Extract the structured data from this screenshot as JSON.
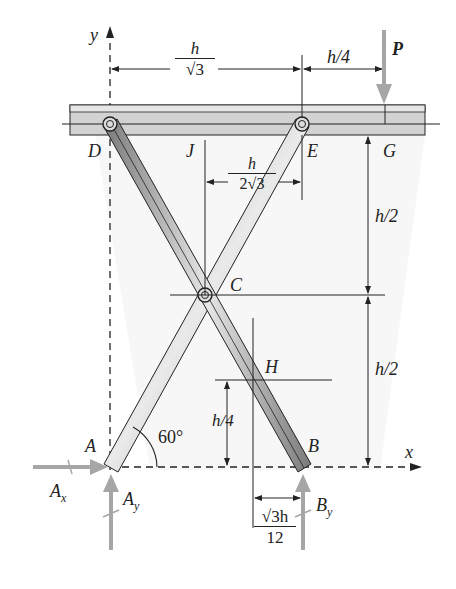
{
  "diagram": {
    "type": "scissor-lift free body diagram",
    "axes": {
      "x_label": "x",
      "y_label": "y"
    },
    "points": {
      "A": "A",
      "B": "B",
      "C": "C",
      "D": "D",
      "E": "E",
      "G": "G",
      "H": "H",
      "J": "J"
    },
    "load": {
      "label": "P"
    },
    "reactions": {
      "Ax": {
        "main": "A",
        "sub": "x"
      },
      "Ay": {
        "main": "A",
        "sub": "y"
      },
      "By": {
        "main": "B",
        "sub": "y"
      }
    },
    "angle": "60°",
    "dimensions": {
      "DE": {
        "num": "h",
        "den": "√3"
      },
      "EG": "h/4",
      "JE": {
        "num": "h",
        "den": "2√3"
      },
      "upper_height": "h/2",
      "lower_height": "h/2",
      "H_height": "h/4",
      "H_offset": {
        "num": "√3h",
        "den": "12"
      }
    },
    "colors": {
      "member_dark": "#6e6e6e",
      "member_light": "#e2e2e2",
      "beam_fill": "#cfcfcf",
      "force_arrow": "#a6a6a6",
      "line": "#222222"
    }
  }
}
